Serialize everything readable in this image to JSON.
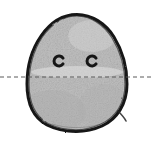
{
  "figure": {
    "canvas": {
      "width": 153,
      "height": 142
    },
    "background_color": "#ffffff",
    "medium": "pencil / ink scan"
  },
  "blob": {
    "name": "egg-shaped blob body",
    "outline_color": "#141414",
    "outline_width_px": 3,
    "fill_color": "#b9b9b9",
    "fill_highlight_color": "#d2d2d2",
    "fill_shadow_color": "#a3a3a3",
    "texture": "grainy pencil shading",
    "bounds": {
      "left": 27,
      "top": 14,
      "right": 127,
      "bottom": 131
    },
    "widest_y": 95,
    "apex_x": 77
  },
  "eyes": [
    {
      "name": "left-eye",
      "glyph": "C",
      "center_x": 59,
      "center_y": 61,
      "radius": 5,
      "stroke_color": "#151515",
      "stroke_width_px": 3,
      "opening_direction": "right"
    },
    {
      "name": "right-eye",
      "glyph": "C",
      "center_x": 92,
      "center_y": 61,
      "radius": 5,
      "stroke_color": "#151515",
      "stroke_width_px": 3,
      "opening_direction": "right"
    }
  ],
  "dashed_line": {
    "name": "horizontal symmetry reference line",
    "orientation": "horizontal",
    "y": 77,
    "x_start": 0,
    "x_end": 153,
    "color": "#5a5a5a",
    "stroke_width_px": 1,
    "dash_px": 4,
    "gap_px": 3,
    "spans_full_width": true
  },
  "labels": {
    "alt_text": "A hand-drawn grey egg-shaped blob with two small C-shaped eyes, crossed horizontally by a dashed reference line that extends past both sides of the blob.",
    "caption": ""
  }
}
